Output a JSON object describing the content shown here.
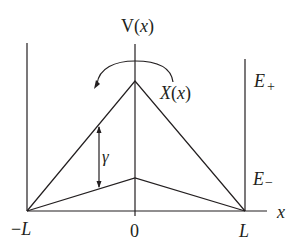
{
  "diagram": {
    "type": "potential-energy-diagram",
    "labels": {
      "v_axis": "V(x)",
      "v_axis_prefix": "V(",
      "v_axis_var": "x",
      "v_axis_suffix": ")",
      "x_axis": "x",
      "e_plus_main": "E",
      "e_plus_sub": "+",
      "e_minus_main": "E",
      "e_minus_sub": "−",
      "operator_main": "X",
      "operator_arg_open": "(",
      "operator_arg_var": "x",
      "operator_arg_close": ")",
      "gamma": "γ",
      "tick_left": "−L",
      "tick_left_sign": "−",
      "tick_left_var": "L",
      "tick_center": "0",
      "tick_right": "L"
    },
    "geometry": {
      "baseline_y": 211,
      "left_wall_x": 27,
      "center_x": 135,
      "right_wall_x": 245,
      "upper_apex_y": 81,
      "lower_apex_y": 178
    },
    "colors": {
      "line": "#231f20",
      "background": "#ffffff"
    }
  }
}
